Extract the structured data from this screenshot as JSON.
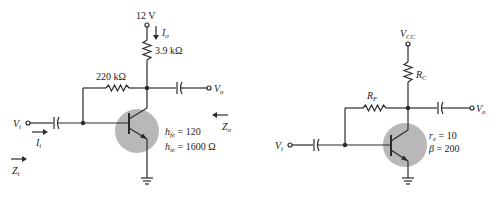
{
  "circuits": [
    {
      "id": "left",
      "supply_label": "12 V",
      "output_current_label": "I",
      "output_current_sub": "o",
      "collector_resistor_label": "3.9 kΩ",
      "feedback_resistor_label": "220 kΩ",
      "input_label": "V",
      "input_sub": "i",
      "output_label": "V",
      "output_sub": "o",
      "input_current_label": "I",
      "input_current_sub": "i",
      "input_impedance_label": "Z",
      "input_impedance_sub": "i",
      "output_impedance_label": "Z",
      "output_impedance_sub": "o",
      "param1_sym": "h",
      "param1_sub": "fe",
      "param1_val": " = 120",
      "param2_sym": "h",
      "param2_sub": "ie",
      "param2_val": " = 1600 Ω"
    },
    {
      "id": "right",
      "supply_label": "V",
      "supply_sub": "CC",
      "collector_resistor_label": "R",
      "collector_resistor_sub": "C",
      "feedback_resistor_label": "R",
      "feedback_resistor_sub": "F",
      "input_label": "V",
      "input_sub": "i",
      "output_label": "V",
      "output_sub": "o",
      "param1_sym": "r",
      "param1_sub": "e",
      "param1_val": " = 10",
      "param2_sym": "β",
      "param2_val": " = 200"
    }
  ],
  "colors": {
    "wire": "#2a2a2a",
    "transistor_highlight": "#b8b8b8",
    "background": "#ffffff"
  }
}
